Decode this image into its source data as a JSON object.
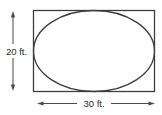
{
  "figure": {
    "height": {
      "value": 20,
      "unit": "ft",
      "label": "20 ft."
    },
    "width": {
      "value": 30,
      "unit": "ft",
      "label": "30 ft."
    },
    "colors": {
      "stroke": "#3d3d3d",
      "dimension_lines": "#4a4a4a",
      "text": "#2b2b2b",
      "background": "#ffffff"
    }
  }
}
